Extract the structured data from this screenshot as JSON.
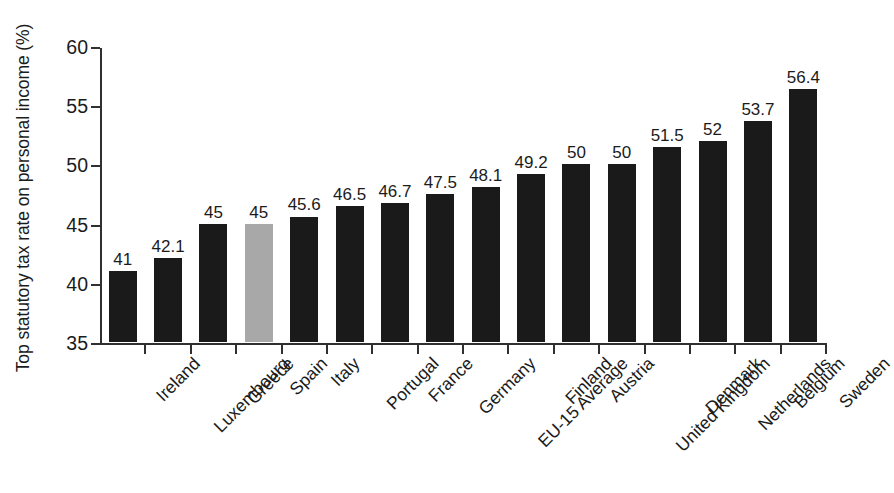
{
  "chart_data": {
    "type": "bar",
    "title": "",
    "xlabel": "",
    "ylabel": "Top statutory tax rate on personal income (%)",
    "ylim": [
      35,
      60
    ],
    "yticks": [
      35,
      40,
      45,
      50,
      55,
      60
    ],
    "ytick_labels": [
      "35",
      "40",
      "45",
      "50",
      "55",
      "60"
    ],
    "grid": false,
    "legend": null,
    "categories": [
      "Ireland",
      "Luxembourg",
      "Greece",
      "Spain",
      "Italy",
      "Portugal",
      "France",
      "Germany",
      "EU-15 Average",
      "Finland",
      "Austria",
      "United Kingdom",
      "Denmark",
      "Netherlands",
      "Belgium",
      "Sweden"
    ],
    "values": [
      41,
      42.1,
      45,
      45,
      45.6,
      46.5,
      46.7,
      47.5,
      48.1,
      49.2,
      50,
      50,
      51.5,
      52,
      53.7,
      56.4
    ],
    "data_labels": [
      "41",
      "42.1",
      "45",
      "45",
      "45.6",
      "46.5",
      "46.7",
      "47.5",
      "48.1",
      "49.2",
      "50",
      "50",
      "51.5",
      "52",
      "53.7",
      "56.4"
    ],
    "highlighted_category": "Spain",
    "bar_color": "#1a1a1a",
    "highlight_bar_color": "#a8a8a8",
    "axis_color": "#303030"
  }
}
